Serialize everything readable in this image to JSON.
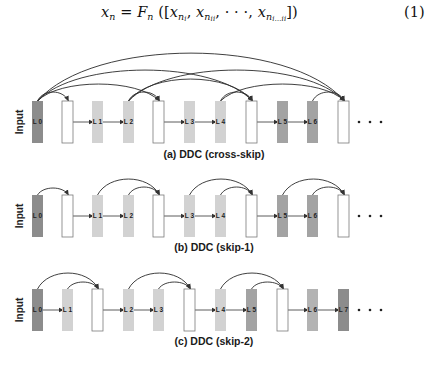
{
  "equation": {
    "lhs": "x",
    "lhs_sub": "n",
    "eq": "=",
    "func": "F",
    "func_sub": "n",
    "terms": [
      {
        "base": "x",
        "sub": "n",
        "subsub": "i"
      },
      {
        "base": "x",
        "sub": "n",
        "subsub": "ii"
      },
      {
        "base": "x",
        "sub": "n",
        "subsub": "i…ii"
      }
    ],
    "ellipsis": "· · ·",
    "number": "(1)",
    "latex": "x_n = F_n([x_{n_i}, x_{n_{ii}}, \\cdots, x_{n_{i\\cdots ii}}])"
  },
  "figure": {
    "input_label": "Input",
    "ellipsis": "•   •   •",
    "colors": {
      "dark": "#8c8c8c",
      "light": "#d2d2d2",
      "mid": "#a3a3a3",
      "mid_light": "#b3b3b3",
      "concat": "#ffffff",
      "stroke": "#8a8a8a",
      "arrow": "#333333"
    },
    "panels": [
      {
        "caption": "(a) DDC (cross-skip)",
        "blocks": [
          {
            "label": "L 0",
            "type": "dark"
          },
          {
            "label": "",
            "type": "concat"
          },
          {
            "label": "L 1",
            "type": "light"
          },
          {
            "label": "L 2",
            "type": "light"
          },
          {
            "label": "",
            "type": "concat"
          },
          {
            "label": "L 3",
            "type": "light"
          },
          {
            "label": "L 4",
            "type": "light"
          },
          {
            "label": "",
            "type": "concat"
          },
          {
            "label": "L 5",
            "type": "mid"
          },
          {
            "label": "L 6",
            "type": "mid"
          },
          {
            "label": "",
            "type": "concat"
          }
        ]
      },
      {
        "caption": "(b) DDC (skip-1)",
        "blocks": [
          {
            "label": "L 0",
            "type": "dark"
          },
          {
            "label": "",
            "type": "concat"
          },
          {
            "label": "L 1",
            "type": "light"
          },
          {
            "label": "L 2",
            "type": "light"
          },
          {
            "label": "",
            "type": "concat"
          },
          {
            "label": "L 3",
            "type": "light"
          },
          {
            "label": "L 4",
            "type": "light"
          },
          {
            "label": "",
            "type": "concat"
          },
          {
            "label": "L 5",
            "type": "mid"
          },
          {
            "label": "L 6",
            "type": "mid"
          },
          {
            "label": "",
            "type": "concat"
          }
        ]
      },
      {
        "caption": "(c) DDC (skip-2)",
        "blocks": [
          {
            "label": "L 0",
            "type": "dark"
          },
          {
            "label": "L 1",
            "type": "light"
          },
          {
            "label": "",
            "type": "concat"
          },
          {
            "label": "L 2",
            "type": "light"
          },
          {
            "label": "L 3",
            "type": "light"
          },
          {
            "label": "",
            "type": "concat"
          },
          {
            "label": "L 4",
            "type": "light"
          },
          {
            "label": "L 5",
            "type": "mid"
          },
          {
            "label": "",
            "type": "concat"
          },
          {
            "label": "L 6",
            "type": "mid_light"
          },
          {
            "label": "L 7",
            "type": "dark"
          }
        ]
      }
    ]
  }
}
